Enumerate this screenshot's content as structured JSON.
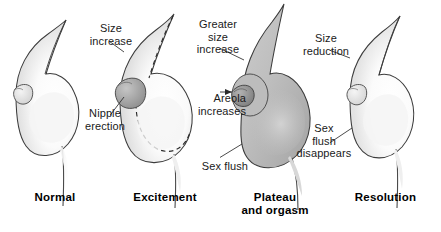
{
  "figure": {
    "background_color": "#ffffff",
    "text_color": "#1a1a1a",
    "label_color": "#000000",
    "outline_color": "#3c3c3c",
    "flush_fill_color": "#b9b9b9",
    "nipple_fill_color": "#a8a8a8",
    "shade_color": "#e8e8e8"
  },
  "panels": [
    {
      "id": "normal",
      "stage_label": "Normal",
      "annotations": []
    },
    {
      "id": "excitement",
      "stage_label": "Excitement",
      "annotations": [
        {
          "id": "size-increase",
          "text": "Size\nincrease"
        },
        {
          "id": "nipple-erection",
          "text": "Nipple\nerection"
        }
      ]
    },
    {
      "id": "plateau-and-orgasm",
      "stage_label": "Plateau\nand orgasm",
      "annotations": [
        {
          "id": "greater-size-increase",
          "text": "Greater\nsize\nincrease"
        },
        {
          "id": "areola-increases",
          "text": "Areola\nincreases"
        },
        {
          "id": "sex-flush",
          "text": "Sex flush"
        }
      ]
    },
    {
      "id": "resolution",
      "stage_label": "Resolution",
      "annotations": [
        {
          "id": "size-reduction",
          "text": "Size\nreduction"
        },
        {
          "id": "sex-flush-disappears",
          "text": "Sex\nflush\ndisappears"
        }
      ]
    }
  ]
}
